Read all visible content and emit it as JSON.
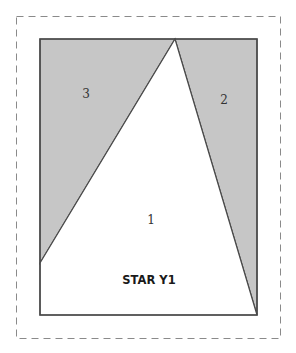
{
  "diagram": {
    "title": "STAR Y1",
    "colors": {
      "background": "#ffffff",
      "shaded": "#c6c6c6",
      "outline": "#4a4a4a",
      "seam_allowance": "#8a8a8a"
    },
    "seam_allowance_border": {
      "x": 16,
      "y": 16,
      "width": 265,
      "height": 323,
      "style": "dashed"
    },
    "block": {
      "x": 40,
      "y": 39,
      "width": 217,
      "height": 276
    },
    "pieces": [
      {
        "id": "1",
        "label": "1",
        "fill": "white",
        "points": "40,263 175,39 257,315 40,315",
        "label_pos": [
          151,
          224
        ]
      },
      {
        "id": "2",
        "label": "2",
        "fill": "shaded",
        "points": "175,39 257,39 257,315",
        "label_pos": [
          224,
          104
        ]
      },
      {
        "id": "3",
        "label": "3",
        "fill": "shaded",
        "points": "40,39 175,39 40,263",
        "label_pos": [
          86,
          98
        ]
      }
    ]
  }
}
